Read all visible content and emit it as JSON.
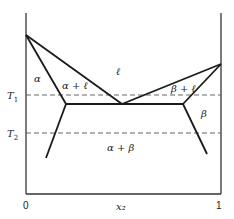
{
  "diagram": {
    "type": "binary eutectic phase diagram",
    "axis": {
      "x_label": "x₂",
      "x_ticks": [
        "0",
        "1"
      ],
      "temperature_lines": [
        {
          "label": "T₁",
          "subscript_base": "T",
          "subscript": "1"
        },
        {
          "label": "T₂",
          "subscript_base": "T",
          "subscript": "2"
        }
      ]
    },
    "regions": {
      "liquid": "ℓ",
      "alpha": "α",
      "alpha_liquid": "α + ℓ",
      "beta": "β",
      "beta_liquid": "β + ℓ",
      "alpha_beta": "α + β"
    },
    "colors": {
      "line": "#1a1a1a",
      "dashed": "#555555",
      "background": "#ffffff"
    }
  }
}
